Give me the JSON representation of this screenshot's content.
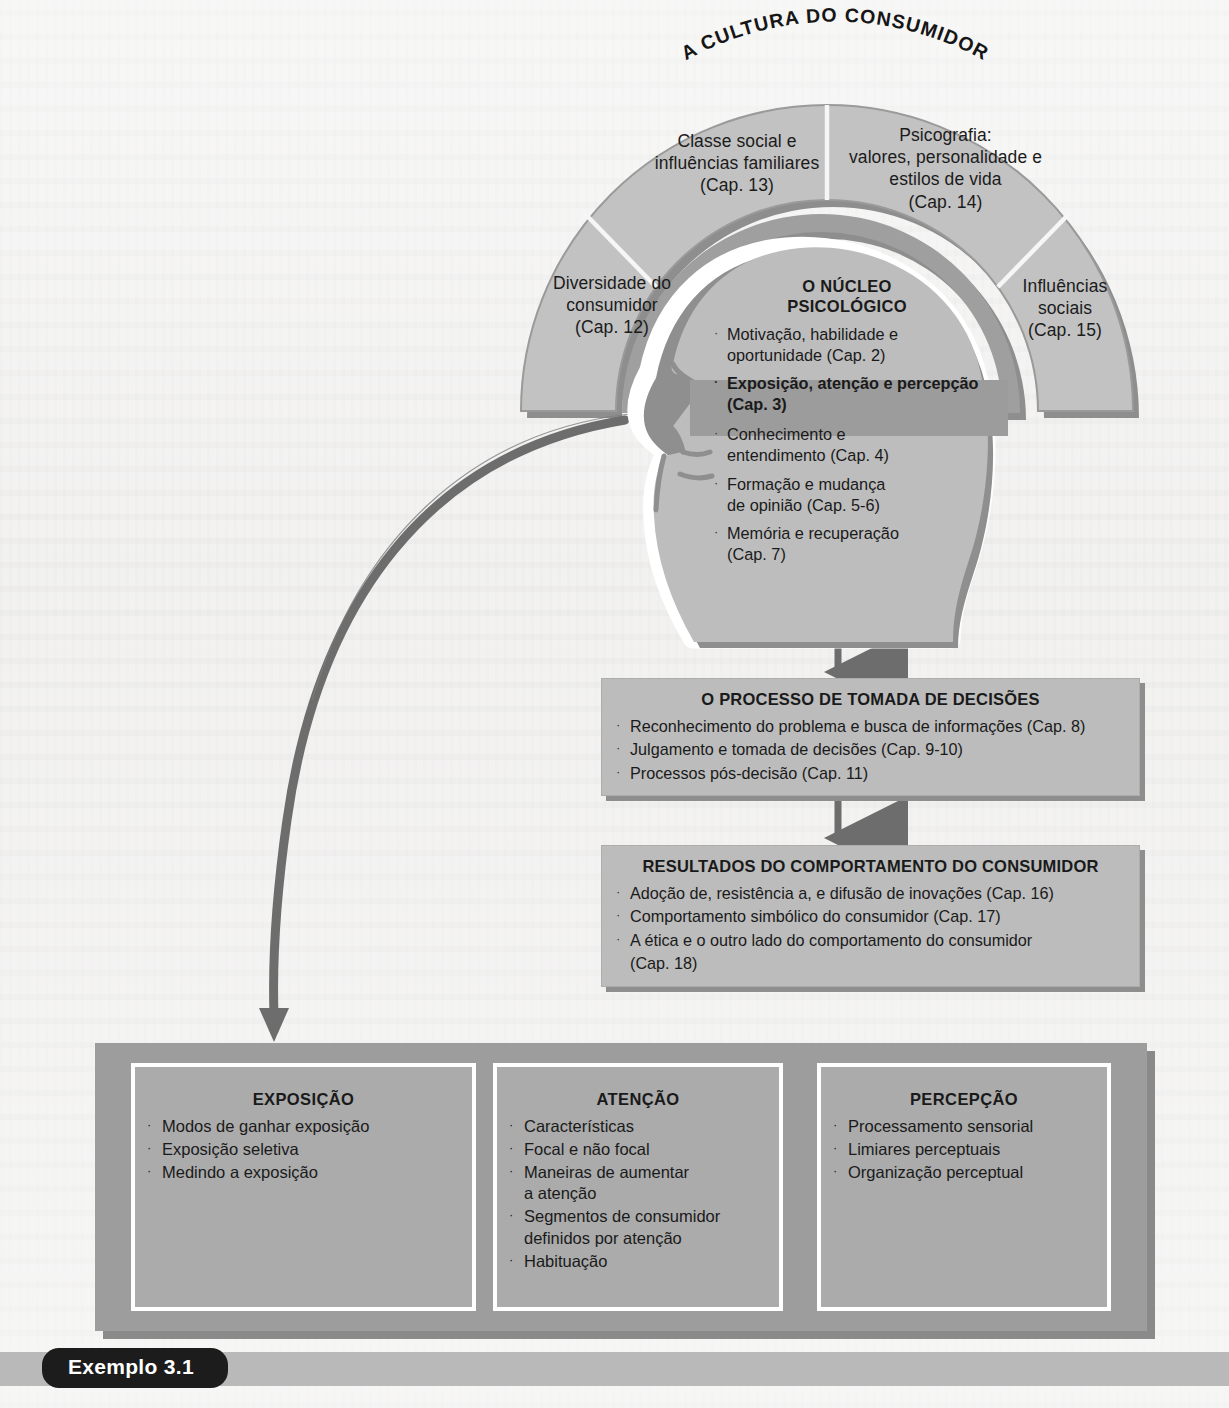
{
  "figure": {
    "title_arc": "A CULTURA DO CONSUMIDOR",
    "caption_label": "Exemplo 3.1"
  },
  "culture_arc": {
    "wedges": [
      {
        "id": "diversidade",
        "lines": [
          "Diversidade do",
          "consumidor",
          "(Cap. 12)"
        ]
      },
      {
        "id": "classe-social",
        "lines": [
          "Classe social e",
          "influências familiares",
          "(Cap. 13)"
        ]
      },
      {
        "id": "psicografia",
        "lines": [
          "Psicografia:",
          "valores, personalidade e",
          "estilos de vida",
          "(Cap. 14)"
        ]
      },
      {
        "id": "influencias-sociais",
        "lines": [
          "Influências",
          "sociais",
          "(Cap. 15)"
        ]
      }
    ]
  },
  "psychological_core": {
    "title_line1": "O NÚCLEO",
    "title_line2": "PSICOLÓGICO",
    "items": [
      {
        "lines": [
          "Motivação, habilidade e",
          "oportunidade (Cap. 2)"
        ],
        "highlighted": false
      },
      {
        "lines": [
          "Exposição, atenção e percepção",
          "(Cap. 3)"
        ],
        "highlighted": true
      },
      {
        "lines": [
          "Conhecimento e",
          "entendimento (Cap. 4)"
        ],
        "highlighted": false
      },
      {
        "lines": [
          "Formação e mudança",
          "de opinião (Cap. 5-6)"
        ],
        "highlighted": false
      },
      {
        "lines": [
          "Memória e recuperação",
          "(Cap. 7)"
        ],
        "highlighted": false
      }
    ]
  },
  "decision_process": {
    "title": "O PROCESSO DE TOMADA DE DECISÕES",
    "items": [
      "Reconhecimento do problema e busca de informações (Cap. 8)",
      "Julgamento e tomada de decisões (Cap. 9-10)",
      "Processos pós-decisão (Cap. 11)"
    ]
  },
  "outcomes": {
    "title": "RESULTADOS DO COMPORTAMENTO DO CONSUMIDOR",
    "items": [
      "Adoção de, resistência a, e difusão de inovações (Cap. 16)",
      "Comportamento simbólico do consumidor (Cap. 17)",
      "A ética e o outro lado do comportamento do consumidor"
    ],
    "item3_continuation": "(Cap. 18)"
  },
  "bottom_panel": {
    "boxes": [
      {
        "title": "EXPOSIÇÃO",
        "items": [
          [
            "Modos de ganhar exposição"
          ],
          [
            "Exposição seletiva"
          ],
          [
            "Medindo a exposição"
          ]
        ]
      },
      {
        "title": "ATENÇÃO",
        "items": [
          [
            "Características"
          ],
          [
            "Focal e não focal"
          ],
          [
            "Maneiras de aumentar",
            "a atenção"
          ],
          [
            "Segmentos de consumidor",
            "definidos por atenção"
          ],
          [
            "Habituação"
          ]
        ]
      },
      {
        "title": "PERCEPÇÃO",
        "items": [
          [
            "Processamento sensorial"
          ],
          [
            "Limiares perceptuais"
          ],
          [
            "Organização perceptual"
          ]
        ]
      }
    ]
  },
  "colors": {
    "page_background": "#eeedec",
    "arc_fill": "#c2c2c2",
    "arc_edge_shadow": "#8e8e8e",
    "head_fill": "#bdbdbd",
    "head_outline": "#8f8f8f",
    "highlight_band": "#9c9c9c",
    "process_box_fill": "#bcbcbc",
    "bottom_panel_fill": "#9d9d9d",
    "bottom_box_fill": "#ababab",
    "arrow_gray": "#6d6d6d",
    "caption_tag": "#1c1c1c"
  },
  "icons": {
    "bullet": "·",
    "arrow_down": "arrow-down-icon",
    "arrow_right": "arrow-right-icon",
    "curved_arrow": "curved-arrow-icon"
  }
}
